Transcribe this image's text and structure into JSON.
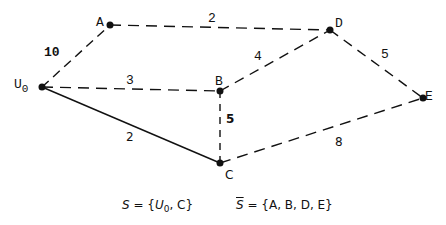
{
  "nodes": [
    {
      "id": "U0",
      "label": "U",
      "sub": "0",
      "x": 42,
      "y": 87
    },
    {
      "id": "A",
      "label": "A",
      "x": 110,
      "y": 25
    },
    {
      "id": "D",
      "label": "D",
      "x": 330,
      "y": 30
    },
    {
      "id": "B",
      "label": "B",
      "x": 220,
      "y": 91
    },
    {
      "id": "E",
      "label": "E",
      "x": 423,
      "y": 98
    },
    {
      "id": "C",
      "label": "C",
      "x": 220,
      "y": 163
    }
  ],
  "edges": [
    {
      "from": "U0",
      "to": "A",
      "weight": "10",
      "style": "dashed"
    },
    {
      "from": "A",
      "to": "D",
      "weight": "2",
      "style": "dashed"
    },
    {
      "from": "U0",
      "to": "B",
      "weight": "3",
      "style": "dashed"
    },
    {
      "from": "B",
      "to": "D",
      "weight": "4",
      "style": "dashed"
    },
    {
      "from": "D",
      "to": "E",
      "weight": "5",
      "style": "dashed"
    },
    {
      "from": "U0",
      "to": "C",
      "weight": "2",
      "style": "solid"
    },
    {
      "from": "B",
      "to": "C",
      "weight": "5",
      "style": "dashed"
    },
    {
      "from": "C",
      "to": "E",
      "weight": "8",
      "style": "dashed"
    }
  ],
  "captions": {
    "s_set": "S = {U0, C}",
    "s_lhs": "S",
    "s_eq": " = {",
    "s_u": "U",
    "s_sub": "0",
    "s_rest": ", C}",
    "sbar_lhs": "S",
    "sbar_rest": " = {A, B, D, E}"
  }
}
